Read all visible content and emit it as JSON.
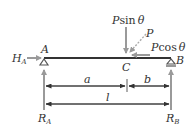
{
  "diagram": {
    "type": "simply-supported-beam",
    "labels": {
      "P_sin": "P",
      "P_sin_fn": "sin",
      "P_sin_theta": "θ",
      "P": "P",
      "P_cos": "P",
      "P_cos_fn": "cos",
      "P_cos_theta": "θ",
      "H_A": "H",
      "H_A_sub": "A",
      "A": "A",
      "B": "B",
      "C": "C",
      "a": "a",
      "b": "b",
      "l": "l",
      "R_A": "R",
      "R_A_sub": "A",
      "R_B": "R",
      "R_B_sub": "B"
    },
    "colors": {
      "beam": "#333333",
      "arrow": "#9a9a9a",
      "dim": "#333333",
      "text": "#333333"
    }
  }
}
